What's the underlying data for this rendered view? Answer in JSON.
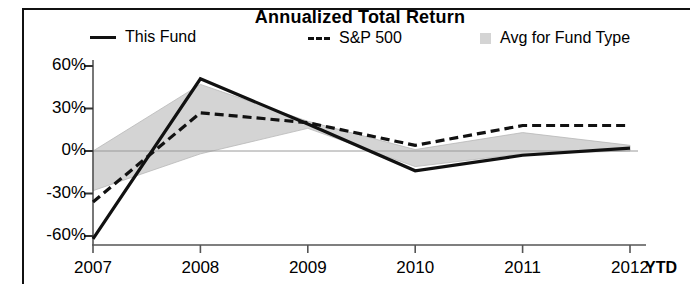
{
  "chart_data": {
    "type": "line",
    "title": "Annualized Total Return",
    "xlabel": "",
    "ylabel": "",
    "x": [
      "2007",
      "2008",
      "2009",
      "2010",
      "2011",
      "2012"
    ],
    "categories": [
      "2007",
      "2008",
      "2009",
      "2010",
      "2011",
      "2012"
    ],
    "xtick_labels": [
      "2007",
      "2008",
      "2009",
      "2010",
      "2011",
      "2012"
    ],
    "xtick_suffix": "YTD",
    "ytick_labels": [
      "60%",
      "30%",
      "0%",
      "-30%",
      "-60%"
    ],
    "ytick_values": [
      60,
      30,
      0,
      -30,
      -60
    ],
    "ylim": [
      -70,
      62
    ],
    "grid": false,
    "zero_line": true,
    "legend_position": "top",
    "series": [
      {
        "name": "This Fund",
        "style": "solid",
        "color": "#111111",
        "values": [
          -62,
          51,
          19,
          -14,
          -3,
          2
        ]
      },
      {
        "name": "S&P 500",
        "style": "dashed",
        "color": "#111111",
        "values": [
          -36,
          27,
          20,
          4,
          18,
          18
        ]
      },
      {
        "name": "Avg for Fund Type",
        "style": "area",
        "color": "#d4d4d4",
        "values_upper": [
          0,
          47,
          21,
          1,
          13,
          4
        ],
        "values_lower": [
          -28,
          -2,
          16,
          -11,
          -2,
          0
        ]
      }
    ]
  },
  "legend": {
    "items": [
      {
        "label": "This Fund",
        "marker": "solid-line-swatch"
      },
      {
        "label": "S&P 500",
        "marker": "dashed-line-swatch"
      },
      {
        "label": "Avg for Fund Type",
        "marker": "area-swatch"
      }
    ]
  }
}
